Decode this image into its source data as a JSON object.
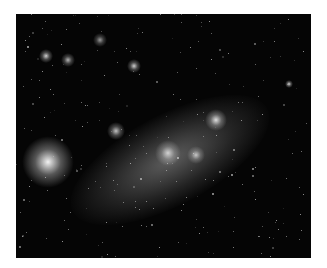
{
  "image": {
    "subject": "irregular galaxy star field (grayscale astronomical photograph)",
    "background_color": "#ffffff",
    "photo_bounds": {
      "x": 16,
      "y": 14,
      "width": 295,
      "height": 244
    },
    "sky_color": "#050505",
    "features": [
      {
        "name": "diffuse-bar",
        "cx": 170,
        "cy": 160,
        "rx": 110,
        "ry": 45,
        "angle": -28,
        "brightness": 0.45
      },
      {
        "name": "bright-nebula-left",
        "cx": 48,
        "cy": 162,
        "r": 12,
        "brightness": 0.95
      },
      {
        "name": "cluster-center",
        "cx": 168,
        "cy": 153,
        "r": 6,
        "brightness": 0.75
      },
      {
        "name": "cluster-upper-right",
        "cx": 216,
        "cy": 120,
        "r": 5,
        "brightness": 0.85
      },
      {
        "name": "cluster-right",
        "cx": 196,
        "cy": 155,
        "r": 4,
        "brightness": 0.7
      },
      {
        "name": "knot-mid-left",
        "cx": 116,
        "cy": 131,
        "r": 4,
        "brightness": 0.75
      },
      {
        "name": "knot-top-left",
        "cx": 46,
        "cy": 56,
        "r": 3,
        "brightness": 0.8
      },
      {
        "name": "knot-top-left-2",
        "cx": 68,
        "cy": 60,
        "r": 3,
        "brightness": 0.7
      },
      {
        "name": "knot-top-mid",
        "cx": 134,
        "cy": 66,
        "r": 3,
        "brightness": 0.8
      },
      {
        "name": "knot-top-2",
        "cx": 100,
        "cy": 40,
        "r": 3,
        "brightness": 0.6
      },
      {
        "name": "star-right",
        "cx": 289,
        "cy": 84,
        "r": 2,
        "brightness": 0.85
      }
    ]
  }
}
